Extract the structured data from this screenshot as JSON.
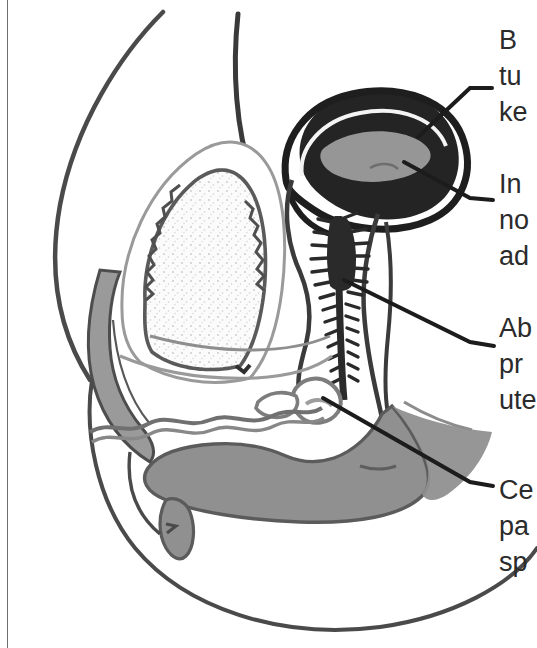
{
  "figure": {
    "type": "anatomical-diagram",
    "view": "midsagittal-section-female-pelvis",
    "background_color": "#ffffff",
    "text_color": "#2b2b2b",
    "border_color": "#6f6f6f"
  },
  "labels": [
    {
      "id": "label-1",
      "name": "label-bladder-tumor",
      "lines": [
        "B",
        "tu",
        "ke"
      ],
      "text": "B\ntu\nke",
      "truncated": true,
      "leader": {
        "from_x": 421,
        "from_y": 135,
        "to_x": 492,
        "to_y": 87
      }
    },
    {
      "id": "label-2",
      "name": "label-invasion-node",
      "lines": [
        "In",
        "no",
        "ad"
      ],
      "text": "In\nno\nad",
      "truncated": true,
      "leader": {
        "from_x": 405,
        "from_y": 163,
        "to_x": 493,
        "to_y": 200
      }
    },
    {
      "id": "label-3",
      "name": "label-abnormal-proximal-uterus",
      "lines": [
        "Ab",
        "pr",
        "ute"
      ],
      "text": "Ab\npr\nute",
      "truncated": true,
      "leader": {
        "from_x": 345,
        "from_y": 281,
        "to_x": 494,
        "to_y": 346
      }
    },
    {
      "id": "label-4",
      "name": "label-cervix-parametrium-spread",
      "lines": [
        "Ce",
        "pa",
        "sp"
      ],
      "text": "Ce\npa\nsp",
      "truncated": true,
      "leader": {
        "from_x": 324,
        "from_y": 399,
        "to_x": 493,
        "to_y": 487
      }
    }
  ],
  "structures": [
    {
      "name": "body-outline",
      "tone": "outline",
      "color": "#4a4a4a"
    },
    {
      "name": "abdominal-wall",
      "tone": "outline",
      "color": "#3a3a3a"
    },
    {
      "name": "pubic-bone",
      "tone": "gray-fill",
      "color": "#9a9a9a"
    },
    {
      "name": "bladder",
      "tone": "stippled-light",
      "color": "#f2f2f2"
    },
    {
      "name": "bladder-wall-crenellated",
      "tone": "outline",
      "color": "#5a5a5a"
    },
    {
      "name": "uterus-mass",
      "tone": "dark-fill",
      "color": "#242424"
    },
    {
      "name": "uterus-cavity",
      "tone": "gray-fill",
      "color": "#969696"
    },
    {
      "name": "vaginal-canal-rugae",
      "tone": "dark-spiky",
      "color": "#2a2a2a"
    },
    {
      "name": "cervix",
      "tone": "gray-outline",
      "color": "#7d7d7d"
    },
    {
      "name": "rectum-anal-canal",
      "tone": "gray-fill",
      "color": "#909090"
    },
    {
      "name": "urethra-labia",
      "tone": "wavy-outline",
      "color": "#707070"
    },
    {
      "name": "leader-lines",
      "tone": "line",
      "color": "#1c1c1c"
    }
  ]
}
